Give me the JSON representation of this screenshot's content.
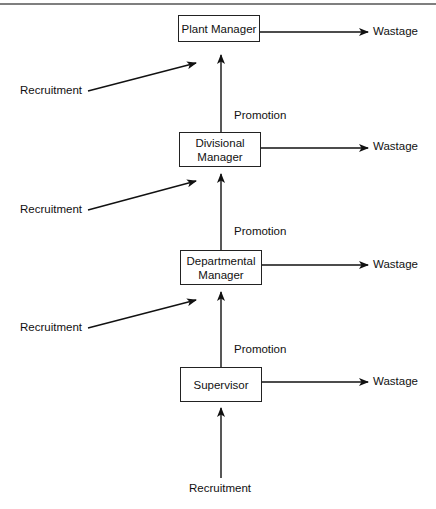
{
  "diagram": {
    "type": "flow",
    "nodes": [
      {
        "id": "plant",
        "label": "Plant Manager",
        "lines": [
          "Plant Manager"
        ]
      },
      {
        "id": "divisional",
        "label": "Divisional Manager",
        "lines": [
          "Divisional",
          "Manager"
        ]
      },
      {
        "id": "departmental",
        "label": "Departmental Manager",
        "lines": [
          "Departmental",
          "Manager"
        ]
      },
      {
        "id": "supervisor",
        "label": "Supervisor",
        "lines": [
          "Supervisor"
        ]
      }
    ],
    "labels": {
      "wastage": "Wastage",
      "recruitment": "Recruitment",
      "promotion": "Promotion"
    },
    "edges": [
      {
        "from": "plant",
        "to": "Wastage"
      },
      {
        "from": "Recruitment",
        "to": "plant"
      },
      {
        "from": "divisional",
        "to": "plant",
        "label": "Promotion"
      },
      {
        "from": "divisional",
        "to": "Wastage"
      },
      {
        "from": "Recruitment",
        "to": "divisional"
      },
      {
        "from": "departmental",
        "to": "divisional",
        "label": "Promotion"
      },
      {
        "from": "departmental",
        "to": "Wastage"
      },
      {
        "from": "Recruitment",
        "to": "departmental"
      },
      {
        "from": "supervisor",
        "to": "departmental",
        "label": "Promotion"
      },
      {
        "from": "supervisor",
        "to": "Wastage"
      },
      {
        "from": "Recruitment",
        "to": "supervisor"
      }
    ]
  }
}
